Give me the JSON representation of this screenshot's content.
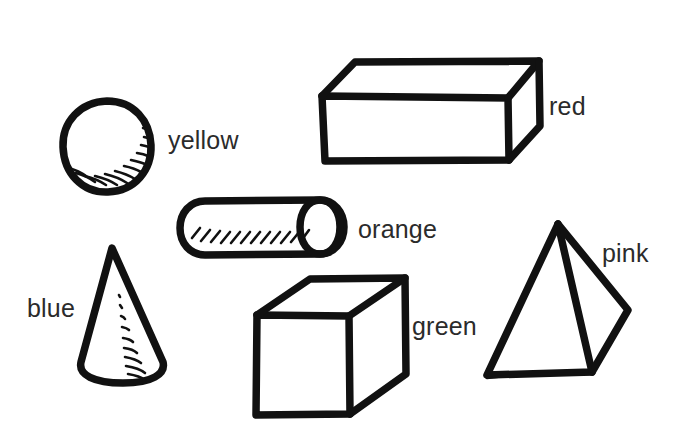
{
  "scene": {
    "title": "Hand-drawn geometric solids with color labels",
    "background_color": "#ffffff",
    "ink_color": "#111111",
    "label_color": "#2b2b2b",
    "width": 679,
    "height": 448
  },
  "shapes": [
    {
      "id": "sphere",
      "name": "sphere",
      "label": "yellow",
      "label_x": 168,
      "label_y": 128,
      "shaded": true
    },
    {
      "id": "box",
      "name": "rectangular-prism",
      "label": "red",
      "label_x": 549,
      "label_y": 94,
      "shaded": false
    },
    {
      "id": "cylinder",
      "name": "cylinder",
      "label": "orange",
      "label_x": 358,
      "label_y": 217,
      "shaded": true
    },
    {
      "id": "cone",
      "name": "cone",
      "label": "blue",
      "label_x": 27,
      "label_y": 296,
      "shaded": true
    },
    {
      "id": "cube",
      "name": "cube",
      "label": "green",
      "label_x": 412,
      "label_y": 314,
      "shaded": false
    },
    {
      "id": "pyramid",
      "name": "pyramid",
      "label": "pink",
      "label_x": 602,
      "label_y": 241,
      "shaded": false
    }
  ]
}
